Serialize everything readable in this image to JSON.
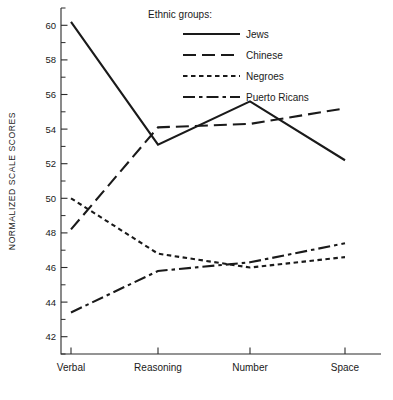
{
  "chart_data": {
    "type": "line",
    "title": "",
    "xlabel": "",
    "ylabel": "NORMALIZED SCALE SCORES",
    "categories": [
      "Verbal",
      "Reasoning",
      "Number",
      "Space"
    ],
    "ylim": [
      41,
      61
    ],
    "ytick_values": [
      42,
      44,
      46,
      48,
      50,
      52,
      54,
      56,
      58,
      60
    ],
    "ytick_labels": [
      "42",
      "44",
      "46",
      "48",
      "50",
      "52",
      "54",
      "56",
      "58",
      "60"
    ],
    "yminor_values": [
      41,
      43,
      45,
      47,
      49,
      51,
      53,
      55,
      57,
      59,
      61
    ],
    "grid": false,
    "legend_position": "top-center",
    "legend_title": "Ethnic groups:",
    "series": [
      {
        "name": "Jews",
        "values": [
          60.2,
          53.1,
          55.6,
          52.2
        ],
        "dash": "none",
        "color": "#1a1a1a"
      },
      {
        "name": "Chinese",
        "values": [
          48.2,
          54.1,
          54.3,
          55.2
        ],
        "dash": "long-dash",
        "color": "#1a1a1a"
      },
      {
        "name": "Negroes",
        "values": [
          50.0,
          46.8,
          46.0,
          46.6
        ],
        "dash": "short-dash",
        "color": "#1a1a1a"
      },
      {
        "name": "Puerto Ricans",
        "values": [
          43.4,
          45.8,
          46.3,
          47.4
        ],
        "dash": "dash-dot",
        "color": "#1a1a1a"
      }
    ]
  }
}
